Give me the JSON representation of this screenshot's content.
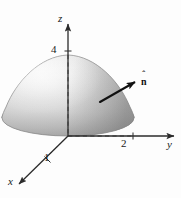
{
  "figure": {
    "background_color": "#fdfdfd",
    "axes": {
      "z": {
        "label": "z",
        "name": "z-axis"
      },
      "y": {
        "label": "y",
        "name": "y-axis"
      },
      "x": {
        "label": "x",
        "name": "x-axis"
      }
    },
    "ticks": {
      "z_value": "4",
      "y_value": "2",
      "x_value": "1"
    },
    "vector": {
      "label": "n",
      "hat": "ˆ",
      "name": "unit-normal-vector"
    },
    "colors": {
      "surface_light": "#f2f2f2",
      "surface_mid": "#d9d9d9",
      "surface_dark": "#a8a8a8",
      "axis_line": "#333333",
      "dashed_line": "#555555",
      "vector_line": "#111111",
      "label_text": "#1a1a1a"
    },
    "geometry": {
      "origin": [
        68,
        136
      ],
      "apex": [
        68,
        55
      ],
      "base_ellipse_rx": 66,
      "base_ellipse_ry": 18,
      "base_ellipse_center": [
        68,
        118
      ],
      "vector_start": [
        101,
        101
      ],
      "vector_end": [
        137,
        81
      ]
    }
  }
}
